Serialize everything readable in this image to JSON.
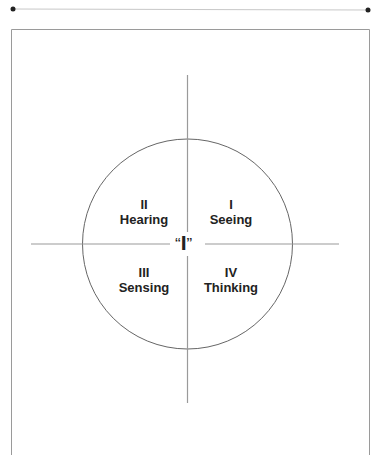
{
  "diagram": {
    "center_label": "“I”",
    "center_open_quote": "“",
    "center_letter": "I",
    "center_close_quote": "”",
    "quadrants": [
      {
        "numeral": "I",
        "label": "Seeing",
        "position": "top-right"
      },
      {
        "numeral": "II",
        "label": "Hearing",
        "position": "top-left"
      },
      {
        "numeral": "III",
        "label": "Sensing",
        "position": "bottom-left"
      },
      {
        "numeral": "IV",
        "label": "Thinking",
        "position": "bottom-right"
      }
    ],
    "colors": {
      "line": "#9a9a9a",
      "circle": "#666666",
      "text": "#222222",
      "dot": "#222222"
    }
  }
}
